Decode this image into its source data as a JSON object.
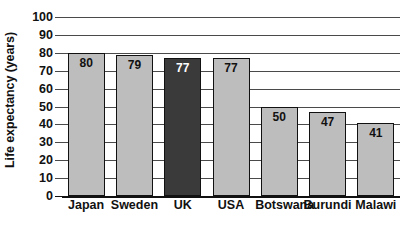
{
  "chart_data": {
    "type": "bar",
    "title": "",
    "subtitle": "",
    "xlabel": "",
    "ylabel": "Life expectancy (years)",
    "categories": [
      "Japan",
      "Sweden",
      "UK",
      "USA",
      "Botswana",
      "Burundi",
      "Malawi"
    ],
    "values": [
      80,
      79,
      77,
      77,
      50,
      47,
      41
    ],
    "value_labels": [
      "80",
      "79",
      "77",
      "77",
      "50",
      "47",
      "41"
    ],
    "ylim": [
      0,
      100
    ],
    "y_ticks": [
      0,
      10,
      20,
      30,
      40,
      50,
      60,
      70,
      80,
      90,
      100
    ],
    "y_tick_labels": [
      "0",
      "10",
      "20",
      "30",
      "40",
      "50",
      "60",
      "70",
      "80",
      "90",
      "100"
    ],
    "grid": true,
    "grid_axis": "y",
    "legend": false,
    "legend_position": "none",
    "highlighted_category": "UK",
    "bar_colors": [
      "#bdbdbd",
      "#bdbdbd",
      "#3a3a3a",
      "#bdbdbd",
      "#bdbdbd",
      "#bdbdbd",
      "#bdbdbd"
    ],
    "bar_border_color": "#111111",
    "value_label_colors": [
      "#111111",
      "#111111",
      "#ffffff",
      "#111111",
      "#111111",
      "#111111",
      "#111111"
    ],
    "gridline_color": "#4a4a4a",
    "axis_color": "#111111",
    "background_color": "#ffffff",
    "text_color": "#111111"
  }
}
